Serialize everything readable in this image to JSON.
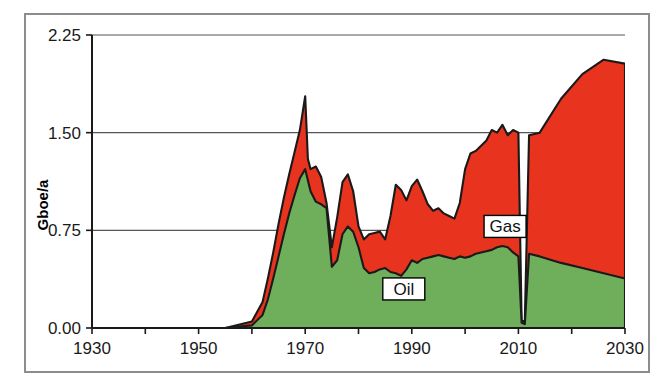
{
  "chart_data": {
    "type": "area",
    "stacked": true,
    "title": "",
    "xlabel": "",
    "ylabel": "Gboe/a",
    "xlim": [
      1930,
      2030
    ],
    "ylim": [
      0.0,
      2.25
    ],
    "xticks": [
      1930,
      1950,
      1970,
      1990,
      2010,
      2030
    ],
    "xtick_labels": [
      "1930",
      "1950",
      "1970",
      "1990",
      "2010",
      "2030"
    ],
    "xminor_tick_step": 10,
    "yticks": [
      0.0,
      0.75,
      1.5,
      2.25
    ],
    "ytick_labels": [
      "0.00",
      "0.75",
      "1.50",
      "2.25"
    ],
    "grid": "horizontal",
    "legend_position": "inline-annotations",
    "colors": {
      "oil": "#6FAF5C",
      "gas": "#E8331E",
      "outline": "#1a1a1a",
      "axis": "#1a1a1a",
      "grid": "#555555",
      "frame": "#8d8d8d",
      "background": "#ffffff"
    },
    "annotations": [
      {
        "text": "Oil",
        "x": 1988.5,
        "y": 0.3,
        "boxed": true
      },
      {
        "text": "Gas",
        "x": 2007.5,
        "y": 0.78,
        "boxed": true
      }
    ],
    "series": [
      {
        "name": "Oil",
        "color": "#6FAF5C",
        "x": [
          1930,
          1955,
          1960,
          1962,
          1963,
          1964,
          1965,
          1966,
          1967,
          1968,
          1969,
          1970,
          1971,
          1972,
          1973,
          1974,
          1975,
          1976,
          1977,
          1978,
          1979,
          1980,
          1981,
          1982,
          1983,
          1984,
          1985,
          1986,
          1987,
          1988,
          1989,
          1990,
          1991,
          1992,
          1993,
          1994,
          1995,
          1996,
          1997,
          1998,
          1999,
          2000,
          2001,
          2002,
          2003,
          2004,
          2005,
          2006,
          2007,
          2008,
          2009,
          2010,
          2010.6,
          2011.2,
          2012,
          2014,
          2018,
          2022,
          2026,
          2030
        ],
        "values": [
          0.0,
          0.0,
          0.02,
          0.1,
          0.22,
          0.38,
          0.55,
          0.72,
          0.88,
          1.02,
          1.15,
          1.22,
          1.05,
          0.97,
          0.95,
          0.92,
          0.47,
          0.52,
          0.72,
          0.78,
          0.74,
          0.62,
          0.46,
          0.42,
          0.43,
          0.45,
          0.46,
          0.43,
          0.42,
          0.4,
          0.45,
          0.52,
          0.5,
          0.53,
          0.54,
          0.55,
          0.56,
          0.55,
          0.54,
          0.53,
          0.55,
          0.54,
          0.55,
          0.57,
          0.58,
          0.59,
          0.6,
          0.62,
          0.63,
          0.62,
          0.58,
          0.55,
          0.04,
          0.03,
          0.57,
          0.55,
          0.5,
          0.46,
          0.42,
          0.38
        ]
      },
      {
        "name": "Gas",
        "color": "#E8331E",
        "x": [
          1930,
          1955,
          1960,
          1962,
          1963,
          1964,
          1965,
          1966,
          1967,
          1968,
          1969,
          1970,
          1970.5,
          1971,
          1972,
          1973,
          1974,
          1975,
          1976,
          1977,
          1978,
          1979,
          1980,
          1981,
          1982,
          1983,
          1984,
          1985,
          1986,
          1987,
          1988,
          1989,
          1990,
          1991,
          1992,
          1993,
          1994,
          1995,
          1996,
          1997,
          1998,
          1999,
          2000,
          2001,
          2002,
          2003,
          2004,
          2005,
          2006,
          2007,
          2008,
          2009,
          2010,
          2010.6,
          2011.2,
          2012,
          2014,
          2018,
          2022,
          2026,
          2030
        ],
        "stack_top": [
          0.0,
          0.0,
          0.05,
          0.2,
          0.38,
          0.58,
          0.8,
          1.0,
          1.18,
          1.35,
          1.52,
          1.78,
          1.3,
          1.22,
          1.24,
          1.16,
          0.96,
          0.62,
          0.85,
          1.12,
          1.18,
          1.05,
          0.78,
          0.68,
          0.72,
          0.73,
          0.74,
          0.68,
          0.86,
          1.1,
          1.06,
          0.98,
          1.09,
          1.14,
          1.05,
          0.95,
          0.9,
          0.92,
          0.88,
          0.86,
          0.84,
          0.96,
          1.22,
          1.34,
          1.36,
          1.4,
          1.44,
          1.52,
          1.5,
          1.56,
          1.48,
          1.52,
          1.5,
          0.06,
          0.05,
          1.48,
          1.5,
          1.76,
          1.95,
          2.06,
          2.03
        ]
      }
    ],
    "notes": {
      "units": "Gboe/a",
      "description": "Stacked area chart of oil (green, lower band) and gas (red, upper band) volumes; sharp near-zero notch at ~2011; projection rises to ~2.03 by 2030."
    }
  },
  "axis": {
    "y_label": "Gboe/a"
  },
  "labels": {
    "oil": "Oil",
    "gas": "Gas"
  }
}
